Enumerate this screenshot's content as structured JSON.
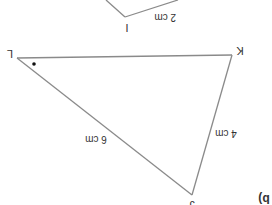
{
  "diagram": {
    "orientation": "rotated 180 degrees (upside down)",
    "part_label": "b)",
    "stroke_color": "#8a8a8a",
    "text_color": "#333333",
    "triangle_main": {
      "vertices": {
        "L": {
          "label": "L",
          "x": 17,
          "y": 58
        },
        "K": {
          "label": "K",
          "x": 232,
          "y": 55
        },
        "J": {
          "label": "J",
          "x": 192,
          "y": 195
        }
      },
      "sides": [
        {
          "from": "L",
          "to": "J",
          "length_label": "6 cm"
        },
        {
          "from": "K",
          "to": "J",
          "length_label": "4 cm"
        },
        {
          "from": "L",
          "to": "K",
          "length_label": ""
        }
      ],
      "angle_marker": {
        "vertex": "L",
        "type": "dot"
      }
    },
    "triangle_partial": {
      "vertex_label": "I",
      "side_label": "2 cm"
    }
  }
}
